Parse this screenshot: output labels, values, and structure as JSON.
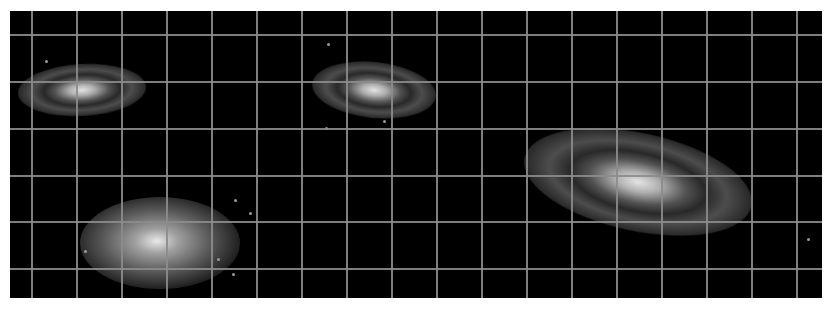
{
  "image": {
    "width": 831,
    "height": 310,
    "background": "#ffffff",
    "panel": {
      "x": 10,
      "y": 11,
      "width": 812,
      "height": 287,
      "color": "#000000"
    },
    "grid": {
      "color": "#8c8c8c",
      "vertical_x": [
        32,
        77,
        122,
        167,
        212,
        257,
        302,
        347,
        392,
        437,
        482,
        527,
        572,
        617,
        662,
        707,
        752,
        797
      ],
      "horizontal_y": [
        35,
        82,
        129,
        176,
        222,
        269
      ]
    },
    "galaxies": [
      {
        "name": "galaxy-top-left",
        "type": "spiral",
        "cx": 82,
        "cy": 90,
        "w": 128,
        "h": 52,
        "rotate": -3
      },
      {
        "name": "galaxy-top-middle",
        "type": "spiral",
        "cx": 374,
        "cy": 90,
        "w": 124,
        "h": 56,
        "rotate": 6
      },
      {
        "name": "galaxy-bottom-left",
        "type": "elliptical",
        "cx": 160,
        "cy": 243,
        "w": 160,
        "h": 92,
        "rotate": 0
      },
      {
        "name": "galaxy-right-large",
        "type": "spiral",
        "cx": 638,
        "cy": 182,
        "w": 232,
        "h": 98,
        "rotate": 12
      }
    ],
    "stars": [
      {
        "x": 325,
        "y": 127
      },
      {
        "x": 383,
        "y": 120
      },
      {
        "x": 234,
        "y": 199
      },
      {
        "x": 232,
        "y": 273
      },
      {
        "x": 249,
        "y": 212
      },
      {
        "x": 84,
        "y": 250
      },
      {
        "x": 807,
        "y": 238
      },
      {
        "x": 45,
        "y": 60
      },
      {
        "x": 327,
        "y": 43
      },
      {
        "x": 217,
        "y": 258
      }
    ]
  }
}
